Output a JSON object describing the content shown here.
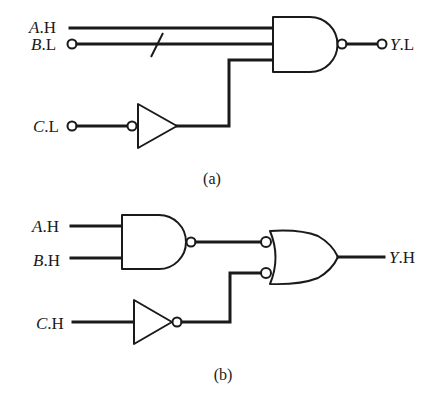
{
  "diagram_a": {
    "caption": "(a)",
    "inputs": [
      {
        "var": "A",
        "suffix": ".H",
        "bubble": false
      },
      {
        "var": "B",
        "suffix": ".L",
        "bubble": true,
        "bus_slash": true
      },
      {
        "var": "C",
        "suffix": ".L",
        "bubble": true
      }
    ],
    "gates": [
      {
        "type": "inverter",
        "input_bubble": true,
        "input": "C.L"
      },
      {
        "type": "nand",
        "inputs": 3
      }
    ],
    "output": {
      "var": "Y",
      "suffix": ".L",
      "bubble": true
    }
  },
  "diagram_b": {
    "caption": "(b)",
    "inputs": [
      {
        "var": "A",
        "suffix": ".H"
      },
      {
        "var": "B",
        "suffix": ".H"
      },
      {
        "var": "C",
        "suffix": ".H"
      }
    ],
    "gates": [
      {
        "type": "nand",
        "inputs": 2
      },
      {
        "type": "inverter",
        "output_bubble": true
      },
      {
        "type": "or",
        "inputs": 2,
        "input_bubbles": true
      }
    ],
    "output": {
      "var": "Y",
      "suffix": ".H"
    }
  },
  "colors": {
    "ink": "#1a1a1a",
    "background": "#ffffff"
  }
}
